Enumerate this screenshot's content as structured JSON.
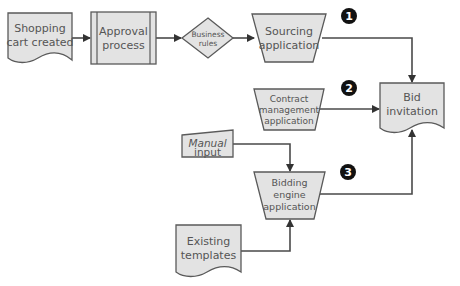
{
  "diagram": {
    "nodes": {
      "shopping_cart": {
        "line1": "Shopping",
        "line2": "cart created",
        "shape": "document"
      },
      "approval": {
        "line1": "Approval",
        "line2": "process",
        "shape": "predefined-process"
      },
      "business_rules": {
        "line1": "Business",
        "line2": "rules",
        "shape": "decision"
      },
      "sourcing": {
        "line1": "Sourcing",
        "line2": "application",
        "shape": "manual-operation"
      },
      "contract": {
        "line1": "Contract",
        "line2": "management",
        "line3": "application",
        "shape": "manual-operation"
      },
      "bid_invitation": {
        "line1": "Bid",
        "line2": "invitation",
        "shape": "document"
      },
      "manual_input": {
        "line1": "Manual",
        "line2": "input",
        "shape": "manual-input"
      },
      "bidding_engine": {
        "line1": "Bidding",
        "line2": "engine",
        "line3": "application",
        "shape": "manual-operation"
      },
      "existing_templates": {
        "line1": "Existing",
        "line2": "templates",
        "shape": "document"
      }
    },
    "badges": {
      "b1": "1",
      "b2": "2",
      "b3": "3"
    },
    "colors": {
      "fill": "#e3e3e3",
      "stroke": "#5a5a5a",
      "badge": "#111111"
    }
  }
}
